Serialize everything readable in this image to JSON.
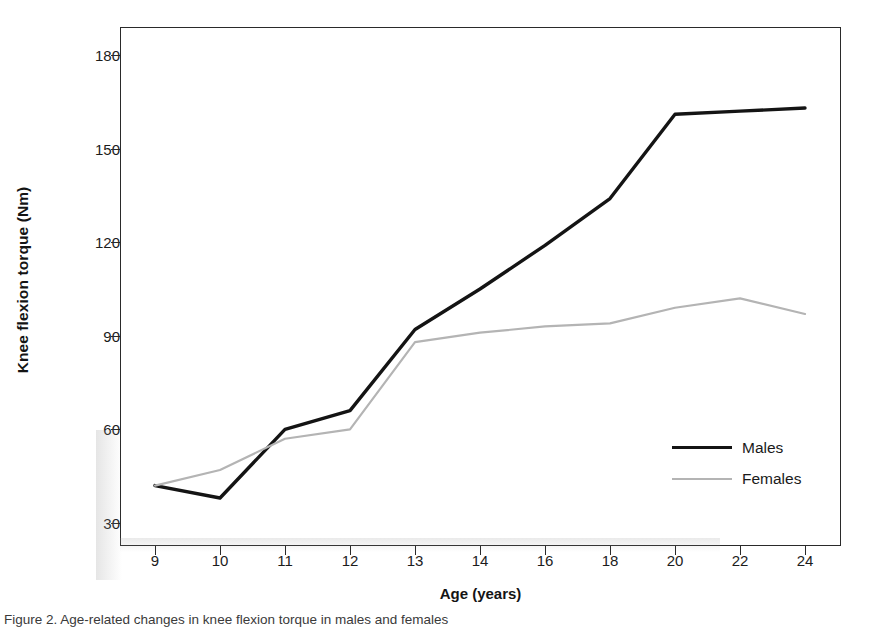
{
  "chart_data": {
    "type": "line",
    "title": "",
    "xlabel": "Age (years)",
    "ylabel": "Knee flexion torque (Nm)",
    "categories": [
      "9",
      "10",
      "11",
      "12",
      "13",
      "14",
      "16",
      "18",
      "20",
      "22",
      "24"
    ],
    "xtick_labels": [
      "9",
      "10",
      "11",
      "12",
      "13",
      "14",
      "16",
      "18",
      "20",
      "22",
      "24"
    ],
    "ytick_labels": [
      "30",
      "60",
      "90",
      "120",
      "150",
      "180"
    ],
    "yticks": [
      30,
      60,
      90,
      120,
      150,
      180
    ],
    "ylim": [
      20,
      190
    ],
    "grid": false,
    "legend_position": "inside-lower-right",
    "series": [
      {
        "name": "Males",
        "color": "#141414",
        "linewidth": 3.4,
        "values": [
          42,
          38,
          60,
          66,
          92,
          105,
          119,
          134,
          161,
          162,
          163
        ]
      },
      {
        "name": "Females",
        "color": "#b4b4b4",
        "linewidth": 2.2,
        "values": [
          42,
          47,
          57,
          60,
          88,
          91,
          93,
          94,
          99,
          102,
          97
        ]
      }
    ]
  },
  "axes": {
    "y_title": "Knee flexion torque (Nm)",
    "x_title": "Age (years)"
  },
  "legend": {
    "entries": [
      {
        "label": "Males"
      },
      {
        "label": "Females"
      }
    ]
  },
  "caption": {
    "text": "Figure 2. Age-related changes in knee flexion torque in males and females"
  }
}
